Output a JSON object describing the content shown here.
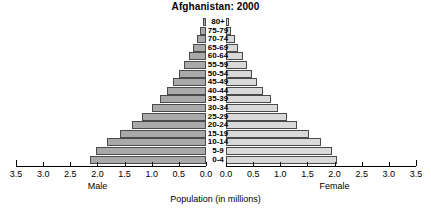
{
  "chart_data": {
    "type": "bar",
    "subtype": "population-pyramid",
    "title": "Afghanistan: 2000",
    "xlabel": "Population (in millions)",
    "ylabel": "",
    "categories": [
      "80+",
      "75-79",
      "70-74",
      "65-69",
      "60-64",
      "55-59",
      "50-54",
      "45-49",
      "40-44",
      "35-39",
      "30-34",
      "25-29",
      "20-24",
      "15-19",
      "10-14",
      "5-9",
      "0-4"
    ],
    "series": [
      {
        "name": "Male",
        "color": "#a9a9a9",
        "direction": "left",
        "values": [
          0.06,
          0.11,
          0.17,
          0.24,
          0.32,
          0.41,
          0.5,
          0.61,
          0.72,
          0.85,
          1.0,
          1.17,
          1.36,
          1.59,
          1.82,
          2.03,
          2.13
        ]
      },
      {
        "name": "Female",
        "color": "#d9d9d9",
        "direction": "right",
        "values": [
          0.05,
          0.1,
          0.16,
          0.23,
          0.31,
          0.39,
          0.48,
          0.58,
          0.69,
          0.82,
          0.96,
          1.12,
          1.31,
          1.53,
          1.75,
          1.95,
          2.05
        ]
      }
    ],
    "xlim": [
      0,
      3.5
    ],
    "ticks": [
      0.0,
      0.5,
      1.0,
      1.5,
      2.0,
      2.5,
      3.0,
      3.5
    ],
    "tick_labels_male": [
      "3.5",
      "3.0",
      "2.5",
      "2.0",
      "1.5",
      "1.0",
      "0.5",
      "0.0"
    ],
    "tick_labels_female": [
      "0.0",
      "0.5",
      "1.0",
      "1.5",
      "2.0",
      "2.5",
      "3.0",
      "3.5"
    ],
    "grid": false,
    "legend": "none",
    "axis_side_labels": {
      "left": "Male",
      "right": "Female"
    }
  }
}
